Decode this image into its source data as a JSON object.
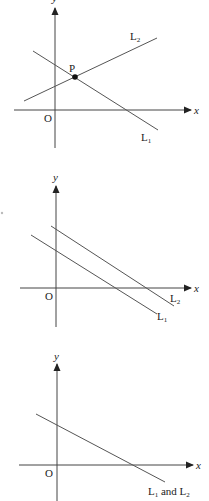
{
  "figure": {
    "width": 209,
    "height": 501,
    "colors": {
      "background": "#ffffff",
      "axis": "#444444",
      "line": "#555555",
      "text": "#222222",
      "point": "#111111"
    },
    "panels": [
      {
        "id": "panel-intersecting",
        "description": "Lines L1 and L2 intersect at point P",
        "axes": {
          "origin": [
            55,
            110
          ],
          "x_axis": {
            "from": [
              14,
              110
            ],
            "to": [
              191,
              110
            ],
            "label": "x",
            "label_pos": [
              194,
              114
            ]
          },
          "y_axis": {
            "from": [
              55,
              148
            ],
            "to": [
              55,
              8
            ],
            "label": "y",
            "label_pos": [
              52,
              2
            ]
          },
          "origin_label": "O",
          "origin_label_pos": [
            44,
            122
          ]
        },
        "lines": [
          {
            "name": "L1",
            "from": [
              33,
              51
            ],
            "to": [
              158,
              130
            ],
            "label": "L",
            "subscript": "1",
            "label_pos": [
              141,
              141
            ]
          },
          {
            "name": "L2",
            "from": [
              24,
              101
            ],
            "to": [
              157,
              38
            ],
            "label": "L",
            "subscript": "2",
            "label_pos": [
              130,
              40
            ]
          }
        ],
        "points": [
          {
            "name": "P",
            "at": [
              75,
              77
            ],
            "label": "P",
            "label_pos": [
              69,
              72
            ]
          }
        ]
      },
      {
        "id": "panel-parallel",
        "description": "Lines L1 and L2 are parallel",
        "axes": {
          "origin": [
            56,
            288
          ],
          "x_axis": {
            "from": [
              20,
              288
            ],
            "to": [
              191,
              288
            ],
            "label": "x",
            "label_pos": [
              194,
              292
            ]
          },
          "y_axis": {
            "from": [
              56,
              327
            ],
            "to": [
              56,
              186
            ],
            "label": "y",
            "label_pos": [
              53,
              181
            ]
          },
          "origin_label": "O",
          "origin_label_pos": [
            45,
            300
          ]
        },
        "lines": [
          {
            "name": "L1",
            "from": [
              31,
              235
            ],
            "to": [
              157,
              314
            ],
            "label": "L",
            "subscript": "1",
            "label_pos": [
              157,
              320
            ]
          },
          {
            "name": "L2",
            "from": [
              51,
              226
            ],
            "to": [
              174,
              306
            ],
            "label": "L",
            "subscript": "2",
            "label_pos": [
              170,
              302
            ]
          }
        ],
        "points": [],
        "stray_mark": {
          "at": [
            2,
            213
          ],
          "r": 1.2
        }
      },
      {
        "id": "panel-coincident",
        "description": "Lines L1 and L2 coincide",
        "axes": {
          "origin": [
            57,
            465
          ],
          "x_axis": {
            "from": [
              19,
              465
            ],
            "to": [
              193,
              465
            ],
            "label": "x",
            "label_pos": [
              196,
              469
            ]
          },
          "y_axis": {
            "from": [
              57,
              501
            ],
            "to": [
              57,
              364
            ],
            "label": "y",
            "label_pos": [
              54,
              360
            ]
          },
          "origin_label": "O",
          "origin_label_pos": [
            45,
            477
          ]
        },
        "lines": [
          {
            "name": "L1 and L2",
            "from": [
              36,
              414
            ],
            "to": [
              165,
              482
            ],
            "label": "L",
            "subscript": "1",
            "label2": " and L",
            "subscript2": "2",
            "label_pos": [
              148,
              495
            ]
          }
        ],
        "points": []
      }
    ]
  }
}
